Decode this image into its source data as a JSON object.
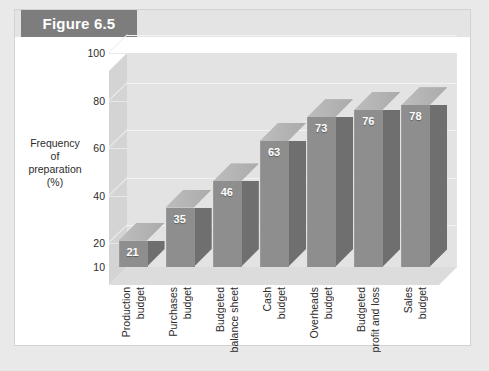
{
  "figure": {
    "badge_label": "Figure 6.5"
  },
  "chart_data": {
    "type": "bar",
    "title": "Figure 6.5",
    "categories": [
      "Production budget",
      "Purchases budget",
      "Budgeted balance sheet",
      "Cash budget",
      "Overheads budget",
      "Budgeted profit and loss",
      "Sales budget"
    ],
    "category_lines": [
      [
        "Production",
        "budget"
      ],
      [
        "Purchases",
        "budget"
      ],
      [
        "Budgeted",
        "balance sheet"
      ],
      [
        "Cash",
        "budget"
      ],
      [
        "Overheads",
        "budget"
      ],
      [
        "Budgeted",
        "profit and loss"
      ],
      [
        "Sales",
        "budget"
      ]
    ],
    "values": [
      21,
      35,
      46,
      63,
      73,
      76,
      78
    ],
    "xlabel": "",
    "ylabel": "Frequency of preparation (%)",
    "ylabel_lines": [
      "Frequency",
      "of",
      "preparation",
      "(%)"
    ],
    "yticks": [
      100,
      80,
      60,
      40,
      20,
      10
    ],
    "ylim": [
      10,
      100
    ],
    "grid": true,
    "legend": "none",
    "colors": {
      "bar_front": "#8e8e8e",
      "bar_side": "#6f6f6f",
      "bar_top": "#b4b4b4",
      "plot_back": "#e3e3e3",
      "plot_floor": "#dcdcdc",
      "plot_left": "#d4d4d4",
      "badge_bg": "#7d7d7d",
      "value_text": "#ffffff",
      "page_bg": "#e9e9e9",
      "panel_bg": "#ffffff"
    }
  }
}
